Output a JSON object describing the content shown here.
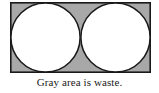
{
  "figure": {
    "caption": "Gray area is waste.",
    "colors": {
      "waste_fill": "#a8a8a8",
      "circle_fill": "#ffffff",
      "stroke": "#1a1a1a",
      "background": "#ffffff",
      "caption_color": "#1a1a1a"
    },
    "rectangle": {
      "name": "sheet-rectangle",
      "x": 10,
      "y": 2,
      "width": 141,
      "height": 71,
      "stroke_width": 1.6
    },
    "circles": [
      {
        "name": "left-circle",
        "label": "left circle",
        "cx": 35.5,
        "cy": 35.5,
        "r": 34.6
      },
      {
        "name": "right-circle",
        "label": "right circle",
        "cx": 105.5,
        "cy": 35.5,
        "r": 34.6
      }
    ]
  }
}
